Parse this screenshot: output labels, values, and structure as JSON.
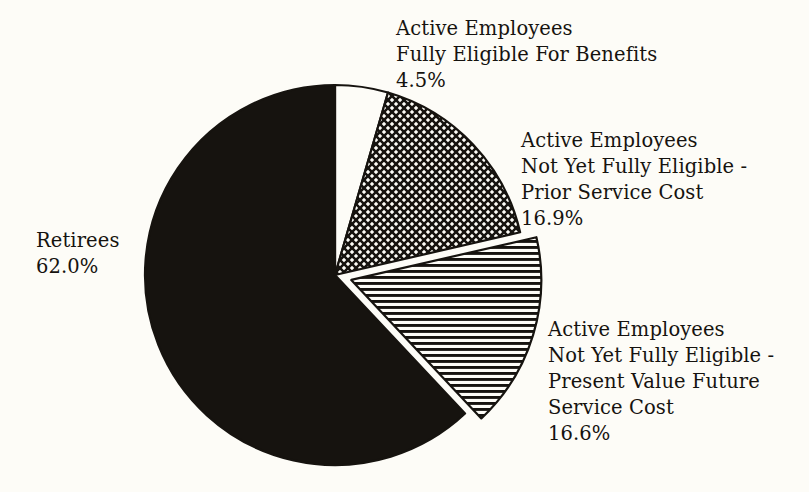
{
  "chart_data": {
    "type": "pie",
    "title": "",
    "subtitle": "",
    "xlabel": "",
    "ylabel": "",
    "legend_position": "none",
    "grid": false,
    "units": "percent",
    "total": 100.0,
    "slices": [
      {
        "name": "active-employees-fully-eligible",
        "label_lines": [
          "Active Employees",
          "Fully Eligible For Benefits"
        ],
        "value": 4.5,
        "value_text": "4.5%",
        "fill_style": "solid-white",
        "fill_color": "#fdfcf7",
        "stroke_color": "#16130f",
        "exploded": false,
        "start_angle_deg": 0.0,
        "end_angle_deg": 16.2,
        "label_position": "top"
      },
      {
        "name": "active-employees-not-yet-eligible-prior-service-cost",
        "label_lines": [
          "Active Employees",
          "Not Yet Fully Eligible -",
          "Prior Service Cost"
        ],
        "value": 16.9,
        "value_text": "16.9%",
        "fill_style": "crosshatch",
        "fill_color": "#16130f",
        "stroke_color": "#16130f",
        "exploded": false,
        "start_angle_deg": 16.2,
        "end_angle_deg": 77.0,
        "label_position": "right"
      },
      {
        "name": "active-employees-not-yet-eligible-present-value-future-service-cost",
        "label_lines": [
          "Active Employees",
          "Not Yet Fully Eligible -",
          "Present Value Future",
          "Service Cost"
        ],
        "value": 16.6,
        "value_text": "16.6%",
        "fill_style": "horizontal-lines",
        "fill_color": "#16130f",
        "stroke_color": "#16130f",
        "exploded": true,
        "start_angle_deg": 77.0,
        "end_angle_deg": 136.8,
        "label_position": "bottom-right"
      },
      {
        "name": "retirees",
        "label_lines": [
          "Retirees"
        ],
        "value": 62.0,
        "value_text": "62.0%",
        "fill_style": "solid-black",
        "fill_color": "#16130f",
        "stroke_color": "#16130f",
        "exploded": false,
        "start_angle_deg": 136.8,
        "end_angle_deg": 360.0,
        "label_position": "left"
      }
    ],
    "categories": [
      "Active Employees Fully Eligible For Benefits",
      "Active Employees Not Yet Fully Eligible - Prior Service Cost",
      "Active Employees Not Yet Fully Eligible - Present Value Future Service Cost",
      "Retirees"
    ],
    "values": [
      4.5,
      16.9,
      16.6,
      62.0
    ]
  },
  "labels": {
    "fully_eligible": {
      "line1": "Active Employees",
      "line2": "Fully Eligible For Benefits",
      "value": "4.5%"
    },
    "prior_service": {
      "line1": "Active Employees",
      "line2": "Not Yet Fully Eligible -",
      "line3": "Prior Service Cost",
      "value": "16.9%"
    },
    "present_value": {
      "line1": "Active Employees",
      "line2": "Not Yet Fully Eligible -",
      "line3": "Present Value Future",
      "line4": "Service Cost",
      "value": "16.6%"
    },
    "retirees": {
      "line1": "Retirees",
      "value": "62.0%"
    }
  },
  "colors": {
    "background": "#fdfcf7",
    "ink": "#16130f",
    "slice_white": "#fdfcf7"
  }
}
